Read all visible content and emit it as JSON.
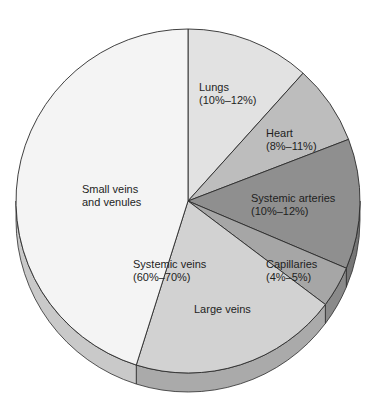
{
  "chart_data": {
    "type": "pie",
    "title": "",
    "style": "3d-extruded",
    "start_angle_deg": 0,
    "direction": "clockwise",
    "slices": [
      {
        "name": "Lungs",
        "range": "10%–12%",
        "angle_start": 0,
        "angle_end": 42,
        "approx_percent": 11.7,
        "color": "#e2e2e2",
        "side_color": "#c4c4c4"
      },
      {
        "name": "Heart",
        "range": "8%–11%",
        "angle_start": 42,
        "angle_end": 69,
        "approx_percent": 7.5,
        "color": "#bdbdbd",
        "side_color": "#9e9e9e"
      },
      {
        "name": "Systemic arteries",
        "range": "10%–12%",
        "angle_start": 69,
        "angle_end": 113,
        "approx_percent": 12.2,
        "color": "#8f8f8f",
        "side_color": "#767676"
      },
      {
        "name": "Capillaries",
        "range": "4%–5%",
        "angle_start": 113,
        "angle_end": 127,
        "approx_percent": 3.9,
        "color": "#a6a6a6",
        "side_color": "#8a8a8a"
      },
      {
        "name": "Large veins",
        "range": "",
        "angle_start": 127,
        "angle_end": 197.5,
        "approx_percent": 19.6,
        "color": "#d2d2d2",
        "side_color": "#aaaaaa"
      },
      {
        "name": "Small veins and venules",
        "range": "",
        "angle_start": 197.5,
        "angle_end": 360,
        "approx_percent": 45.1,
        "color": "#f4f4f4",
        "side_color": "#c9c9c9"
      }
    ],
    "group_labels": [
      {
        "name": "Systemic veins",
        "range": "60%–70%",
        "includes": [
          "Large veins",
          "Small veins and venules"
        ]
      }
    ],
    "legend": "none"
  },
  "labels": {
    "lungs": {
      "name": "Lungs",
      "range": "(10%–12%)"
    },
    "heart": {
      "name": "Heart",
      "range": "(8%–11%)"
    },
    "systemic_arteries": {
      "name": "Systemic arteries",
      "range": "(10%–12%)"
    },
    "capillaries": {
      "name": "Capillaries",
      "range": "(4%–5%)"
    },
    "systemic_veins": {
      "name": "Systemic veins",
      "range": "(60%–70%)"
    },
    "large_veins": {
      "name": "Large veins"
    },
    "small_veins": {
      "line1": "Small veins",
      "line2": "and venules"
    }
  },
  "geometry": {
    "cx": 188,
    "cy": 201,
    "r": 172,
    "depth": 19
  },
  "colors": {
    "outline": "#2b2b2b",
    "text": "#1e1e1e",
    "background": "#ffffff"
  }
}
